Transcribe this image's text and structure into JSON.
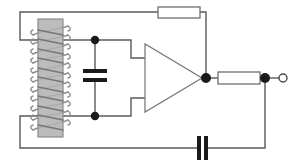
{
  "diagram": {
    "type": "electronic-schematic",
    "canvas": {
      "width": 307,
      "height": 165,
      "background": "#ffffff"
    },
    "style": {
      "wire_color": "#5a5a5a",
      "wire_width": 1.4,
      "component_outline": "#6b6b6b",
      "component_fill": "#ffffff",
      "core_fill": "#b3b3b3",
      "core_stroke": "#8c8c8c",
      "coil_stroke": "#7a7a7a",
      "plate_fill": "#1a1a1a",
      "node_fill": "#1a1a1a",
      "terminal_stroke": "#4a4a4a",
      "terminal_fill": "#ffffff"
    },
    "components": [
      {
        "id": "inductor",
        "name": "coil-inductor",
        "label": "",
        "shape": "helical-winding-on-core",
        "core": {
          "x": 38,
          "y": 19,
          "width": 25,
          "height": 118
        },
        "winding": {
          "turns": 11,
          "top": 26,
          "bottom": 130,
          "left": 31,
          "right": 70
        },
        "terminals": {
          "top_y": 40,
          "bottom_y": 116
        }
      },
      {
        "id": "c_shunt",
        "name": "shunt-capacitor",
        "label": "",
        "shape": "parallel-plate-horizontal",
        "x": 95,
        "plate_top_y": 71,
        "plate_bottom_y": 80,
        "plate_half_width": 12,
        "plate_thickness": 4
      },
      {
        "id": "opamp",
        "name": "operational-amplifier",
        "label": "",
        "shape": "triangle",
        "left_x": 145,
        "right_apex_x": 202,
        "top_y": 44,
        "bottom_y": 112,
        "apex_y": 78,
        "input_top_y": 58,
        "input_bottom_y": 98
      },
      {
        "id": "r_feedback",
        "name": "feedback-resistor",
        "label": "",
        "shape": "rectangle",
        "x": 158,
        "y": 7,
        "width": 42,
        "height": 11
      },
      {
        "id": "r_output",
        "name": "output-resistor",
        "label": "",
        "shape": "rectangle",
        "x": 218,
        "y": 72,
        "width": 42,
        "height": 12
      },
      {
        "id": "c_bottom",
        "name": "coupling-capacitor",
        "label": "",
        "shape": "parallel-plate-vertical",
        "y": 148,
        "plate_left_x": 199,
        "plate_right_x": 206,
        "plate_half_height": 12,
        "plate_thickness": 4
      },
      {
        "id": "out_terminal",
        "name": "output-terminal",
        "label": "",
        "shape": "open-circle",
        "cx": 283,
        "cy": 78,
        "r": 4
      }
    ],
    "nodes": [
      {
        "id": "n_top",
        "name": "upper-input-node",
        "cx": 95,
        "cy": 40,
        "r": 4
      },
      {
        "id": "n_bot",
        "name": "lower-input-node",
        "cx": 95,
        "cy": 116,
        "r": 4
      },
      {
        "id": "n_out",
        "name": "amplifier-output-node",
        "cx": 206,
        "cy": 78,
        "r": 5
      },
      {
        "id": "n_tap",
        "name": "output-tap-node",
        "cx": 265,
        "cy": 78,
        "r": 5
      }
    ],
    "wires": [
      {
        "id": "w_coil_top",
        "name": "coil-top-lead",
        "points": "63,40 95,40"
      },
      {
        "id": "w_coil_bot",
        "name": "coil-bottom-lead",
        "points": "63,116 95,116"
      },
      {
        "id": "w_fb_left",
        "name": "feedback-left-branch",
        "points": "38,40 20,40 20,12 158,12"
      },
      {
        "id": "w_fb_right",
        "name": "feedback-right-branch",
        "points": "200,12 206,12 206,78"
      },
      {
        "id": "w_in_top",
        "name": "noninverting-input-wire",
        "points": "95,40 131,40 131,58 145,58"
      },
      {
        "id": "w_in_bot",
        "name": "inverting-input-wire",
        "points": "95,116 131,116 131,98 145,98"
      },
      {
        "id": "w_cap_top",
        "name": "shunt-cap-top-lead",
        "points": "95,40 95,71"
      },
      {
        "id": "w_cap_bot",
        "name": "shunt-cap-bottom-lead",
        "points": "95,80 95,116"
      },
      {
        "id": "w_out_res",
        "name": "output-resistor-lead-left",
        "points": "206,78 218,78"
      },
      {
        "id": "w_res_tap",
        "name": "output-resistor-lead-right",
        "points": "260,78 265,78"
      },
      {
        "id": "w_tap_term",
        "name": "terminal-lead",
        "points": "265,78 279,78"
      },
      {
        "id": "w_bot_right",
        "name": "bottom-return-right",
        "points": "265,78 265,148 206,148"
      },
      {
        "id": "w_bot_left",
        "name": "bottom-return-left",
        "points": "199,148 20,148 20,116 38,116"
      }
    ]
  }
}
